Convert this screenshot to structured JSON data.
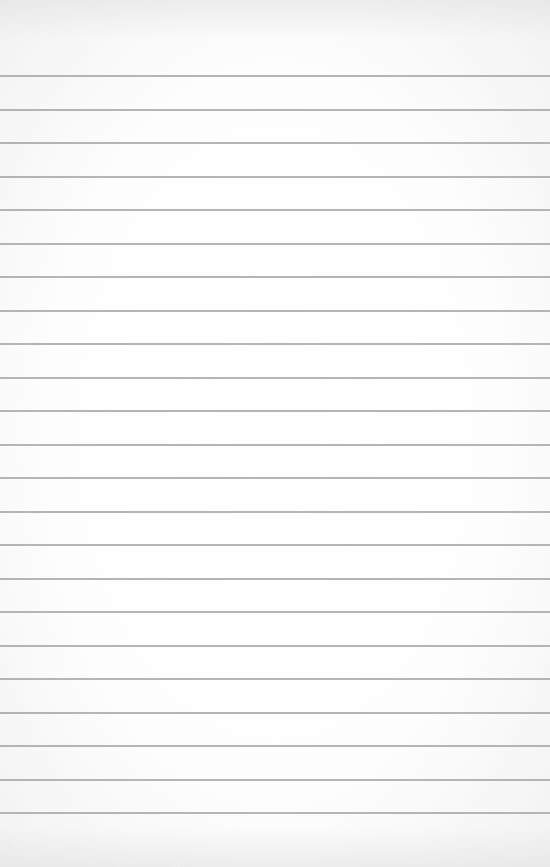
{
  "paper": {
    "type": "lined-paper",
    "background_color": "#fdfdfd",
    "rule_color": "#a8a8a8",
    "rule_count": 23,
    "first_rule_y": 75,
    "rule_spacing": 33.5,
    "text": ""
  }
}
